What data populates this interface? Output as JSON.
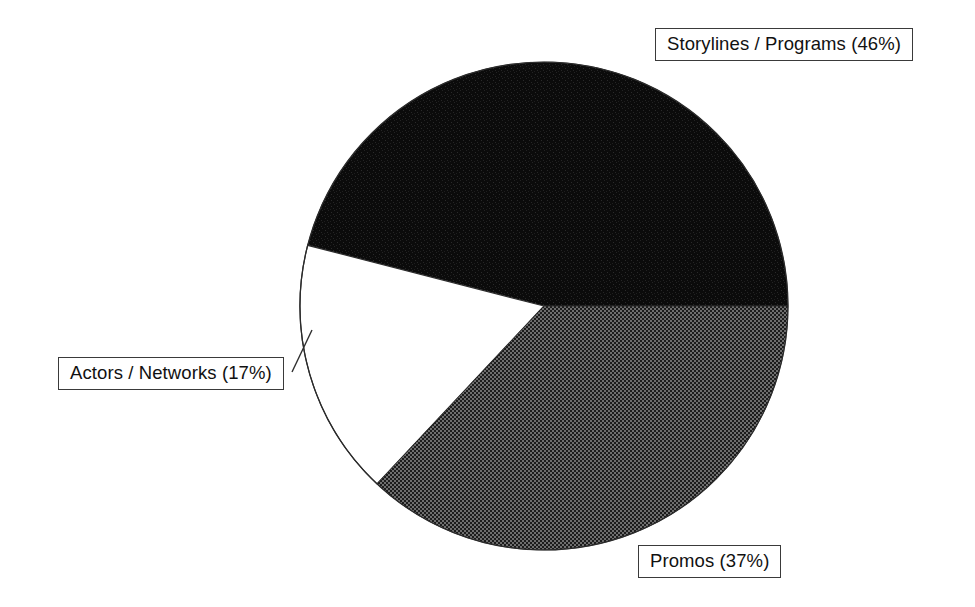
{
  "background_color": "#ffffff",
  "chart_data": {
    "type": "pie",
    "title": "",
    "subtitle": "",
    "xlabel": "",
    "ylabel": "",
    "legend_position": "callout-labels",
    "grid": false,
    "total_percent": 100,
    "start_angle_deg": 0,
    "direction": "counterclockwise",
    "center": {
      "x": 544,
      "y": 306
    },
    "radius": 244,
    "categories": [
      "Storylines / Programs",
      "Promos",
      "Actors / Networks"
    ],
    "values": [
      46,
      37,
      17
    ],
    "slices": [
      {
        "name": "Storylines / Programs",
        "label": "Storylines / Programs (46%)",
        "value": 46,
        "unit": "%",
        "fill": "black",
        "fill_hex": "#0d0d0d",
        "start_deg": 0,
        "end_deg": 165.6
      },
      {
        "name": "Actors / Networks",
        "label": "Actors / Networks (17%)",
        "value": 17,
        "unit": "%",
        "fill": "white",
        "fill_hex": "#ffffff",
        "start_deg": 165.6,
        "end_deg": 226.8
      },
      {
        "name": "Promos",
        "label": "Promos (37%)",
        "value": 37,
        "unit": "%",
        "fill": "gray-dither",
        "fill_hex": "#545454",
        "start_deg": 226.8,
        "end_deg": 360
      }
    ]
  },
  "labels": {
    "storylines": "Storylines / Programs (46%)",
    "actors": "Actors / Networks (17%)",
    "promos": "Promos (37%)"
  }
}
